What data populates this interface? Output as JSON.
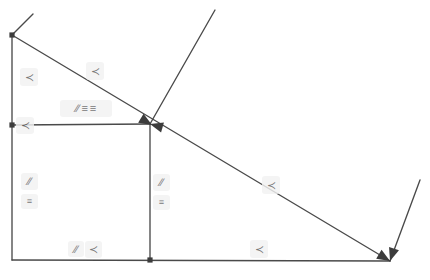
{
  "figure": {
    "background_color": "#ffffff",
    "stroke_color": "#4a4a4a",
    "stroke_color_dark": "#3c3c3c",
    "mark_chip_color": "#f2f2f2",
    "canvas": {
      "width": 430,
      "height": 280
    }
  },
  "points": [
    {
      "name": "point-top-left",
      "id": "A",
      "x": 12,
      "y": 35,
      "style": "dot"
    },
    {
      "name": "point-left-middle",
      "id": "B",
      "x": 12,
      "y": 125,
      "style": "dot"
    },
    {
      "name": "point-center",
      "id": "C",
      "x": 150,
      "y": 124,
      "style": "arrow-node"
    },
    {
      "name": "point-bottom-center",
      "id": "D",
      "x": 150,
      "y": 260,
      "style": "dot"
    },
    {
      "name": "point-bottom-right",
      "id": "E",
      "x": 390,
      "y": 261,
      "style": "arrow-node"
    }
  ],
  "segments": [
    {
      "name": "segment-left-vertical",
      "x1": 12,
      "y1": 35,
      "x2": 12,
      "y2": 260
    },
    {
      "name": "segment-bottom-horizontal",
      "x1": 12,
      "y1": 260,
      "x2": 390,
      "y2": 261
    },
    {
      "name": "segment-mid-horizontal",
      "x1": 12,
      "y1": 125,
      "x2": 150,
      "y2": 124
    },
    {
      "name": "segment-center-vertical",
      "x1": 150,
      "y1": 124,
      "x2": 150,
      "y2": 260
    },
    {
      "name": "segment-main-diagonal",
      "x1": 12,
      "y1": 35,
      "x2": 390,
      "y2": 261
    },
    {
      "name": "ray-upper-right",
      "x1": 150,
      "y1": 124,
      "x2": 215,
      "y2": 10
    },
    {
      "name": "ray-lower-right",
      "x1": 390,
      "y1": 261,
      "x2": 420,
      "y2": 180
    },
    {
      "name": "ray-top-left-stub",
      "x1": 12,
      "y1": 35,
      "x2": 33,
      "y2": 14
    }
  ],
  "arrowheads": [
    {
      "name": "arrowhead-center-left",
      "x": 150,
      "y": 124,
      "angle": 196
    },
    {
      "name": "arrowhead-center-right",
      "x": 152,
      "y": 125,
      "angle": 31
    },
    {
      "name": "arrowhead-bottom-right",
      "x": 390,
      "y": 261,
      "angle": 31
    },
    {
      "name": "arrowhead-bottom-right-2",
      "x": 390,
      "y": 261,
      "angle": 108
    }
  ],
  "marks": [
    {
      "name": "angle-mark-left-upper",
      "type": "angle",
      "glyph": "≺",
      "x": 20,
      "y": 68,
      "w": 18,
      "h": 18
    },
    {
      "name": "angle-mark-diagonal-upper",
      "type": "angle",
      "glyph": "≺",
      "x": 86,
      "y": 62,
      "w": 18,
      "h": 18
    },
    {
      "name": "mark-group-mid-horizontal",
      "type": "group",
      "glyphs": [
        "∕∕",
        "≡",
        "≡"
      ],
      "x": 60,
      "y": 100,
      "w": 52,
      "h": 17
    },
    {
      "name": "angle-mark-left-middle",
      "type": "angle",
      "glyph": "≺",
      "x": 16,
      "y": 117,
      "w": 18,
      "h": 17
    },
    {
      "name": "parallel-mark-left-vertical",
      "type": "parallel",
      "glyph": "∕∕",
      "x": 21,
      "y": 173,
      "w": 17,
      "h": 17
    },
    {
      "name": "equal-mark-left-vertical",
      "type": "equal",
      "glyph": "≡",
      "x": 21,
      "y": 194,
      "w": 17,
      "h": 15
    },
    {
      "name": "parallel-mark-center-vertical",
      "type": "parallel",
      "glyph": "∕∕",
      "x": 153,
      "y": 174,
      "w": 17,
      "h": 17
    },
    {
      "name": "equal-mark-center-vertical",
      "type": "equal",
      "glyph": "≡",
      "x": 153,
      "y": 195,
      "w": 17,
      "h": 15
    },
    {
      "name": "angle-mark-diagonal-lower",
      "type": "angle",
      "glyph": "≺",
      "x": 262,
      "y": 176,
      "w": 18,
      "h": 18
    },
    {
      "name": "parallel-mark-bottom",
      "type": "parallel",
      "glyph": "∕∕",
      "x": 68,
      "y": 241,
      "w": 16,
      "h": 16
    },
    {
      "name": "angle-mark-bottom-left",
      "type": "angle",
      "glyph": "≺",
      "x": 85,
      "y": 241,
      "w": 17,
      "h": 17
    },
    {
      "name": "angle-mark-bottom-right",
      "type": "angle",
      "glyph": "≺",
      "x": 250,
      "y": 240,
      "w": 18,
      "h": 18
    }
  ]
}
